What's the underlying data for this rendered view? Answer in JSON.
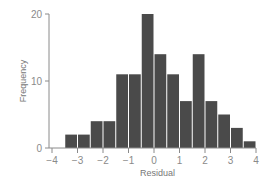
{
  "chart_data": {
    "type": "bar",
    "subtype": "histogram",
    "title": "",
    "xlabel": "Residual",
    "ylabel": "Frequency",
    "bin_width": 0.5,
    "bins": [
      {
        "start": -3.5,
        "end": -3.0,
        "count": 2
      },
      {
        "start": -3.0,
        "end": -2.5,
        "count": 2
      },
      {
        "start": -2.5,
        "end": -2.0,
        "count": 4
      },
      {
        "start": -2.0,
        "end": -1.5,
        "count": 4
      },
      {
        "start": -1.5,
        "end": -1.0,
        "count": 11
      },
      {
        "start": -1.0,
        "end": -0.5,
        "count": 11
      },
      {
        "start": -0.5,
        "end": 0.0,
        "count": 20
      },
      {
        "start": 0.0,
        "end": 0.5,
        "count": 14
      },
      {
        "start": 0.5,
        "end": 1.0,
        "count": 11
      },
      {
        "start": 1.0,
        "end": 1.5,
        "count": 7
      },
      {
        "start": 1.5,
        "end": 2.0,
        "count": 14
      },
      {
        "start": 2.0,
        "end": 2.5,
        "count": 7
      },
      {
        "start": 2.5,
        "end": 3.0,
        "count": 5
      },
      {
        "start": 3.0,
        "end": 3.5,
        "count": 3
      },
      {
        "start": 3.5,
        "end": 4.0,
        "count": 1
      }
    ],
    "xlim": [
      -4,
      4
    ],
    "ylim": [
      0,
      20
    ],
    "xticks": [
      -4,
      -3,
      -2,
      -1,
      0,
      1,
      2,
      3,
      4
    ],
    "xtick_labels": [
      "−4",
      "−3",
      "−2",
      "−1",
      "0",
      "1",
      "2",
      "3",
      "4"
    ],
    "yticks": [
      0,
      10,
      20
    ],
    "ytick_labels": [
      "0",
      "10",
      "20"
    ],
    "grid": false,
    "legend": null,
    "colors": {
      "bar": "#4a4a4a",
      "bar_edge": "#ffffff",
      "axis": "#8a8a8a"
    }
  }
}
